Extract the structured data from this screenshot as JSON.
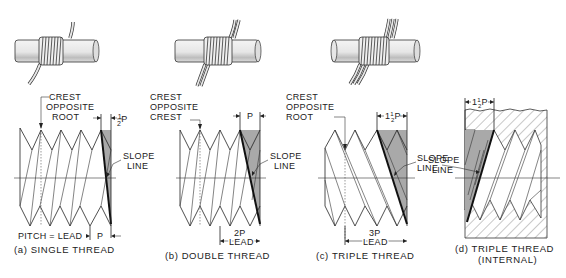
{
  "figure": {
    "panels": [
      {
        "id": "a",
        "caption": "(a) SINGLE THREAD",
        "top_label": [
          "CREST",
          "OPPOSITE",
          "ROOT"
        ],
        "dim_top": "½P",
        "dim_top_whole": "",
        "dim_top_frac": "1/2",
        "side_label": [
          "SLOPE",
          "LINE"
        ],
        "bottom_dim_left": "PITCH = LEAD",
        "bottom_dim_right": "P",
        "pitch_label": "P"
      },
      {
        "id": "b",
        "caption": "(b) DOUBLE THREAD",
        "top_label": [
          "CREST",
          "OPPOSITE",
          "CREST"
        ],
        "dim_top": "P",
        "side_label": [
          "SLOPE",
          "LINE"
        ],
        "bottom_dim_top": "2P",
        "bottom_dim": "LEAD"
      },
      {
        "id": "c",
        "caption": "(c) TRIPLE THREAD",
        "top_label": [
          "CREST",
          "OPPOSITE",
          "ROOT"
        ],
        "dim_top": "1½P",
        "side_label": [
          "SLOPE",
          "LINE"
        ],
        "bottom_dim_top": "3P",
        "bottom_dim": "LEAD"
      },
      {
        "id": "d",
        "caption_line1": "(d) TRIPLE THREAD",
        "caption_line2": "(INTERNAL)",
        "dim_top": "1½P",
        "side_label": [
          "SLOPE",
          "LINE"
        ]
      }
    ],
    "illustrations": [
      {
        "name": "rod-single-wire",
        "wires": 1
      },
      {
        "name": "rod-double-wire",
        "wires": 2
      },
      {
        "name": "rod-triple-wire",
        "wires": 3
      }
    ],
    "colors": {
      "ink": "#222222",
      "shade": "#a9a9a9",
      "rod": "#e8e8e8"
    }
  }
}
